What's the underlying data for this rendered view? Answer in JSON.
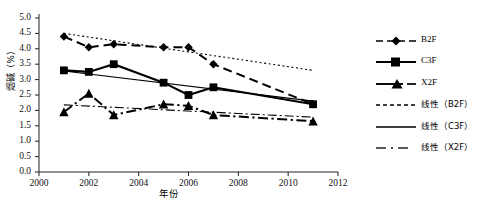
{
  "chart_data": {
    "type": "line",
    "title": "",
    "xlabel": "年份",
    "ylabel": "烟碱（%）",
    "xlim": [
      2000,
      2012
    ],
    "ylim": [
      0.0,
      5.0
    ],
    "grid": false,
    "legend_position": "right",
    "xticks": [
      "2000",
      "2002",
      "2004",
      "2006",
      "2008",
      "2010",
      "2012"
    ],
    "yticks": [
      "0.0",
      "0.5",
      "1.0",
      "1.5",
      "2.0",
      "2.5",
      "3.0",
      "3.5",
      "4.0",
      "4.5",
      "5.0"
    ],
    "x": [
      2001,
      2002,
      2003,
      2005,
      2006,
      2007,
      2011
    ],
    "series": [
      {
        "name": "B2F",
        "marker": "diamond",
        "line": "dashed",
        "values": [
          4.4,
          4.05,
          4.15,
          4.05,
          4.05,
          3.5,
          2.2
        ]
      },
      {
        "name": "C3F",
        "marker": "square",
        "line": "solid",
        "values": [
          3.3,
          3.25,
          3.5,
          2.9,
          2.5,
          2.75,
          2.2
        ]
      },
      {
        "name": "X2F",
        "marker": "triangle",
        "line": "dashdot",
        "values": [
          1.95,
          2.55,
          1.85,
          2.2,
          2.15,
          1.85,
          1.65
        ]
      }
    ],
    "trendlines": [
      {
        "name": "线性（B2F）",
        "line": "dotted",
        "start": [
          2001,
          4.5
        ],
        "end": [
          2011,
          3.3
        ]
      },
      {
        "name": "线性（C3F）",
        "line": "solid",
        "start": [
          2001,
          3.28
        ],
        "end": [
          2011,
          2.3
        ]
      },
      {
        "name": "线性（X2F）",
        "line": "dashdot",
        "start": [
          2001,
          2.18
        ],
        "end": [
          2011,
          1.78
        ]
      }
    ]
  },
  "legend": {
    "items": [
      {
        "label": "B2F",
        "key": "diamond-dashed"
      },
      {
        "label": "C3F",
        "key": "square-solid"
      },
      {
        "label": "X2F",
        "key": "triangle-solid"
      },
      {
        "label": "线性（B2F）",
        "key": "dotted-line"
      },
      {
        "label": "线性（C3F）",
        "key": "solid-line"
      },
      {
        "label": "线性（X2F）",
        "key": "dashdot-line"
      }
    ]
  },
  "caption": ""
}
